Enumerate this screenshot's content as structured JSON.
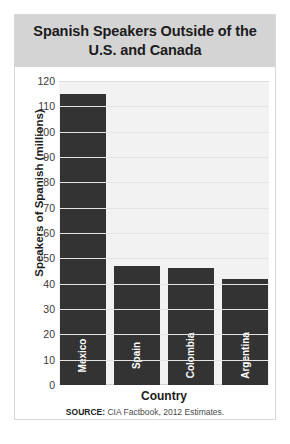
{
  "title": "Spanish Speakers Outside of the U.S. and Canada",
  "source_prefix": "SOURCE:",
  "source_text": "CIA Factbook, 2012 Estimates.",
  "colors": {
    "bar": "#333333",
    "title_band": "#d4d4d4",
    "plot_background": "#f2f2f2",
    "gridline": "#e4e4e4",
    "card_border": "#d8d8d8"
  },
  "chart_data": {
    "type": "bar",
    "title": "Spanish Speakers Outside of the U.S. and Canada",
    "xlabel": "Country",
    "ylabel": "Speakers of Spanish (millions)",
    "categories": [
      "Mexico",
      "Spain",
      "Colombia",
      "Argentina"
    ],
    "values": [
      115,
      47,
      46,
      42
    ],
    "ylim": [
      0,
      120
    ],
    "yticks": [
      0,
      10,
      20,
      30,
      40,
      50,
      60,
      70,
      80,
      90,
      100,
      110,
      120
    ],
    "ytick_labels": [
      "0",
      "10",
      "20",
      "30",
      "40",
      "50",
      "60",
      "70",
      "80",
      "90",
      "100",
      "110",
      "120"
    ],
    "grid": true,
    "legend": false
  }
}
